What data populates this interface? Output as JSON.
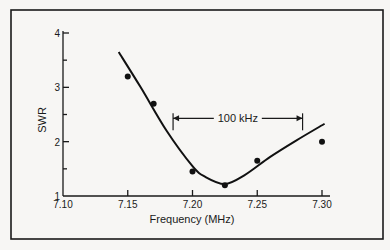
{
  "chart_data": {
    "type": "scatter",
    "title": "",
    "xlabel": "Frequency (MHz)",
    "ylabel": "SWR",
    "xlim": [
      7.1,
      7.3
    ],
    "ylim": [
      1,
      4
    ],
    "x_ticks": [
      "7.10",
      "7.15",
      "7.20",
      "7.25",
      "7.30"
    ],
    "y_ticks": [
      "1",
      "2",
      "3",
      "4"
    ],
    "y_minor_ticks": [
      1.5,
      2.5,
      3.5
    ],
    "grid": false,
    "legend": null,
    "series": [
      {
        "name": "Measured SWR",
        "kind": "scatter",
        "x": [
          7.15,
          7.17,
          7.2,
          7.225,
          7.25,
          7.3
        ],
        "y": [
          3.2,
          2.7,
          1.45,
          1.2,
          1.65,
          2.0
        ]
      },
      {
        "name": "Fitted curve",
        "kind": "line",
        "x": [
          7.143,
          7.16,
          7.18,
          7.2,
          7.21,
          7.225,
          7.24,
          7.26,
          7.28,
          7.302
        ],
        "y": [
          3.65,
          3.0,
          2.2,
          1.55,
          1.35,
          1.22,
          1.38,
          1.72,
          2.02,
          2.33
        ]
      }
    ],
    "annotations": [
      {
        "text": "100 kHz",
        "type": "bracket",
        "x_start": 7.185,
        "x_end": 7.285,
        "y": 2.43
      }
    ]
  }
}
